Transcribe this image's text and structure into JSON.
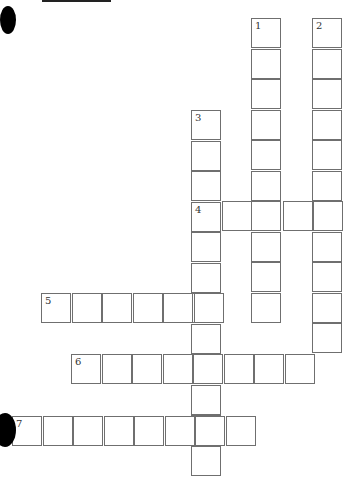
{
  "puzzle": {
    "type": "crossword",
    "cell_size": 30,
    "colors": {
      "border": "#6f6f6f",
      "number": "#333333",
      "background": "#ffffff",
      "punch_hole": "#000000"
    },
    "clues": [
      {
        "number": "1",
        "direction": "down",
        "x": 251,
        "y": 18,
        "length": 10
      },
      {
        "number": "2",
        "direction": "down",
        "x": 312,
        "y": 18,
        "length": 11
      },
      {
        "number": "3",
        "direction": "down",
        "x": 191,
        "y": 110,
        "length": 12
      },
      {
        "number": "4",
        "direction": "across",
        "x": 191,
        "y": 201,
        "length": 5
      },
      {
        "number": "5",
        "direction": "across",
        "x": 41,
        "y": 293,
        "length": 6
      },
      {
        "number": "6",
        "direction": "across",
        "x": 71,
        "y": 354,
        "length": 8
      },
      {
        "number": "7",
        "direction": "across",
        "x": 12,
        "y": 416,
        "length": 8
      }
    ]
  },
  "decorations": {
    "punch_holes": [
      {
        "x": 0,
        "y": 6,
        "size": 16
      },
      {
        "x": -6,
        "y": 413,
        "size": 22
      }
    ]
  }
}
